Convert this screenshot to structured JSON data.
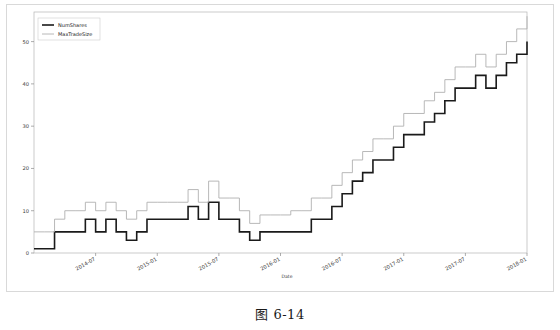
{
  "caption": "图 6-14",
  "chart_data": {
    "type": "line",
    "title": "",
    "subtitle": "",
    "xlabel": "Date",
    "ylabel": "",
    "grid": false,
    "legend_position": "upper-left",
    "drawstyle": "steps-post",
    "xlim": [
      "2014-01",
      "2018-02"
    ],
    "ylim": [
      0,
      57
    ],
    "yticks": [
      0,
      10,
      20,
      30,
      40,
      50
    ],
    "ytick_labels": [
      "0",
      "10",
      "20",
      "30",
      "40",
      "50"
    ],
    "xticks": [
      "2014-07",
      "2015-01",
      "2015-07",
      "2016-01",
      "2016-07",
      "2017-01",
      "2017-07",
      "2018-01"
    ],
    "xtick_labels": [
      "2014-07",
      "2015-01",
      "2015-07",
      "2016-01",
      "2016-07",
      "2017-01",
      "2017-07",
      "2018-01"
    ],
    "colors": {
      "num_shares": "#1a1a1a",
      "max_trade_size": "#b0b0b0"
    },
    "x": [
      "2014-01",
      "2014-02",
      "2014-03",
      "2014-04",
      "2014-05",
      "2014-06",
      "2014-07",
      "2014-08",
      "2014-09",
      "2014-10",
      "2014-11",
      "2014-12",
      "2015-01",
      "2015-02",
      "2015-03",
      "2015-04",
      "2015-05",
      "2015-06",
      "2015-07",
      "2015-08",
      "2015-09",
      "2015-10",
      "2015-11",
      "2015-12",
      "2016-01",
      "2016-02",
      "2016-03",
      "2016-04",
      "2016-05",
      "2016-06",
      "2016-07",
      "2016-08",
      "2016-09",
      "2016-10",
      "2016-11",
      "2016-12",
      "2017-01",
      "2017-02",
      "2017-03",
      "2017-04",
      "2017-05",
      "2017-06",
      "2017-07",
      "2017-08",
      "2017-09",
      "2017-10",
      "2017-11",
      "2017-12",
      "2018-01"
    ],
    "series": [
      {
        "name": "NumShares",
        "color": "#1a1a1a",
        "linewidth": 1.6,
        "values": [
          1,
          1,
          5,
          5,
          5,
          8,
          5,
          8,
          5,
          3,
          5,
          8,
          8,
          8,
          8,
          11,
          8,
          12,
          8,
          8,
          5,
          3,
          5,
          5,
          5,
          5,
          5,
          8,
          8,
          11,
          14,
          17,
          19,
          22,
          22,
          25,
          28,
          28,
          31,
          33,
          36,
          39,
          39,
          42,
          39,
          42,
          45,
          47,
          50
        ]
      },
      {
        "name": "MaxTradeSize",
        "color": "#b0b0b0",
        "linewidth": 0.9,
        "values": [
          5,
          5,
          8,
          10,
          10,
          12,
          10,
          12,
          10,
          8,
          10,
          12,
          12,
          12,
          12,
          15,
          12,
          17,
          13,
          13,
          10,
          7,
          9,
          9,
          9,
          10,
          10,
          13,
          13,
          16,
          19,
          22,
          24,
          27,
          27,
          30,
          33,
          33,
          36,
          38,
          41,
          44,
          44,
          47,
          44,
          47,
          50,
          53,
          56
        ]
      }
    ]
  },
  "legend": {
    "entries": [
      {
        "label": "NumShares"
      },
      {
        "label": "MaxTradeSize"
      }
    ]
  }
}
